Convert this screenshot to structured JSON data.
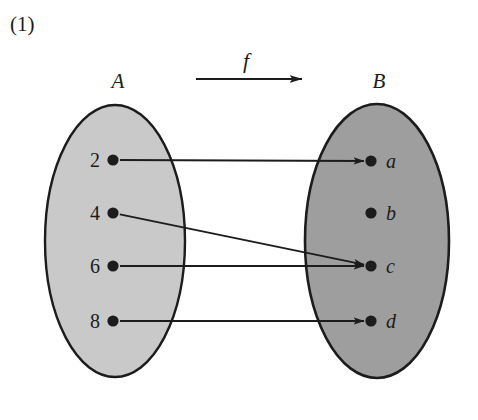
{
  "figure": {
    "number_label": "(1)",
    "function_label": "f",
    "domain_label": "A",
    "codomain_label": "B",
    "background_color": "#ffffff",
    "ink_color": "#1c1c1c"
  },
  "domain_set": {
    "label": "A",
    "fill_color": "#c9c9c9",
    "stroke_color": "#1c1c1c",
    "center": {
      "x": 115,
      "y": 241
    },
    "rx": 70,
    "ry": 136,
    "elements": [
      {
        "name": "2",
        "x": 113,
        "y": 160
      },
      {
        "name": "4",
        "x": 113,
        "y": 213
      },
      {
        "name": "6",
        "x": 113,
        "y": 266
      },
      {
        "name": "8",
        "x": 113,
        "y": 321
      }
    ]
  },
  "codomain_set": {
    "label": "B",
    "fill_color": "#9e9e9e",
    "stroke_color": "#1c1c1c",
    "center": {
      "x": 377,
      "y": 241
    },
    "rx": 72,
    "ry": 137,
    "elements": [
      {
        "name": "a",
        "x": 371,
        "y": 161
      },
      {
        "name": "b",
        "x": 371,
        "y": 213
      },
      {
        "name": "c",
        "x": 371,
        "y": 266
      },
      {
        "name": "d",
        "x": 371,
        "y": 321
      }
    ]
  },
  "function_arrow": {
    "label": "f",
    "x1": 196,
    "x2": 302,
    "y": 79
  },
  "mappings": [
    {
      "from": "2",
      "to": "a",
      "x1": 113,
      "y1": 160,
      "x2": 371,
      "y2": 161
    },
    {
      "from": "4",
      "to": "c",
      "x1": 113,
      "y1": 213,
      "x2": 371,
      "y2": 266
    },
    {
      "from": "6",
      "to": "c",
      "x1": 113,
      "y1": 266,
      "x2": 371,
      "y2": 266
    },
    {
      "from": "8",
      "to": "d",
      "x1": 113,
      "y1": 321,
      "x2": 371,
      "y2": 321
    }
  ]
}
